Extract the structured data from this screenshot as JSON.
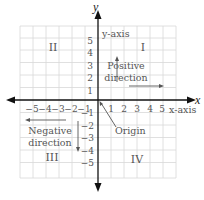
{
  "diagram": {
    "axes": {
      "x_label": "x",
      "y_label": "y",
      "x_axis_caption": "x-axis",
      "y_axis_caption": "y-axis",
      "x_ticks_positive": [
        "1",
        "2",
        "3",
        "4",
        "5"
      ],
      "x_ticks_negative": [
        "−5",
        "−4",
        "−3",
        "−2",
        "−1"
      ],
      "y_ticks_positive": [
        "5",
        "4",
        "3",
        "2",
        "1"
      ],
      "y_ticks_negative": [
        "−1",
        "−2",
        "−3",
        "−4",
        "−5"
      ]
    },
    "quadrants": {
      "q1": "I",
      "q2": "II",
      "q3": "III",
      "q4": "IV"
    },
    "annotations": {
      "positive_line1": "Positive",
      "positive_line2": "direction",
      "negative_line1": "Negative",
      "negative_line2": "direction",
      "origin": "Origin"
    },
    "colors": {
      "grid": "#d8d8d8",
      "axis": "#111111",
      "text": "#555555",
      "arrow": "#555555"
    }
  }
}
